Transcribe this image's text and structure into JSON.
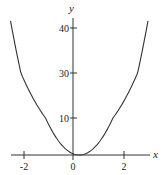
{
  "chart_data": {
    "type": "line",
    "title": "",
    "xlabel": "x",
    "ylabel": "y",
    "xlim": [
      -2.5,
      3.0
    ],
    "ylim": [
      0,
      42
    ],
    "x_ticks": [
      {
        "value": -2,
        "label": "-2"
      },
      {
        "value": 0,
        "label": "0"
      },
      {
        "value": 2,
        "label": "2"
      }
    ],
    "y_ticks": [
      {
        "value": 10,
        "label": "10"
      },
      {
        "value": 30,
        "label": "30"
      },
      {
        "value": 40,
        "label": "40"
      }
    ],
    "grid": false,
    "legend": null,
    "series": [
      {
        "name": "parabola",
        "description": "upward-opening parabola, vertex near (0.25, 0)",
        "x": [
          -2.5,
          -2.0,
          -1.5,
          -1.0,
          -0.5,
          0.0,
          0.25,
          0.5,
          1.0,
          1.5,
          2.0,
          2.5,
          3.0
        ],
        "values": [
          41.6,
          30.9,
          16.8,
          8.6,
          3.1,
          0.3,
          0.0,
          0.3,
          3.1,
          8.6,
          16.8,
          27.8,
          41.6
        ]
      }
    ],
    "color": "#333333"
  },
  "labels": {
    "x_axis": "x",
    "y_axis": "y",
    "tick_x_neg2": "-2",
    "tick_x_0": "0",
    "tick_x_2": "2",
    "tick_y_10": "10",
    "tick_y_30": "30",
    "tick_y_40": "40"
  }
}
